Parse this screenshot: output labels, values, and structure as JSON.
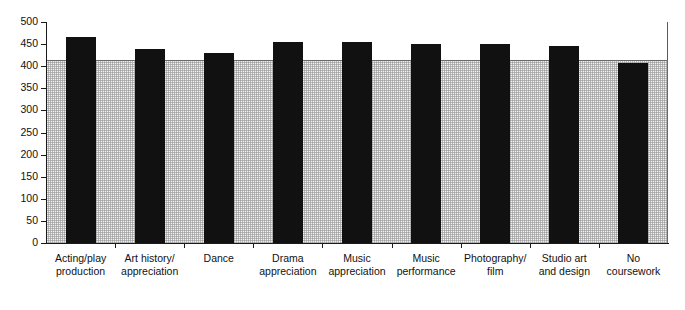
{
  "chart_data": {
    "type": "bar",
    "title": "",
    "xlabel": "",
    "ylabel": "",
    "ylim": [
      0,
      500
    ],
    "ytick_step": 50,
    "yticks": [
      "500",
      "450",
      "400",
      "350",
      "300",
      "250",
      "200",
      "150",
      "100",
      "50",
      "0"
    ],
    "grid": false,
    "legend": null,
    "bar_color": "#111111",
    "plot_background": "#f2f2f2",
    "reference_line": {
      "value": 415,
      "color": "#6a6a6a",
      "label": ""
    },
    "categories": [
      "Acting/play production",
      "Art history/ appreciation",
      "Dance",
      "Drama appreciation",
      "Music appreciation",
      "Music performance",
      "Photography/ film",
      "Studio art and design",
      "No coursework"
    ],
    "category_lines": [
      [
        "Acting/play",
        "production"
      ],
      [
        "Art history/",
        "appreciation"
      ],
      [
        "Dance",
        ""
      ],
      [
        "Drama",
        "appreciation"
      ],
      [
        "Music",
        "appreciation"
      ],
      [
        "Music",
        "performance"
      ],
      [
        "Photography/",
        "film"
      ],
      [
        "Studio art",
        "and design"
      ],
      [
        "No",
        "coursework"
      ]
    ],
    "values": [
      465,
      440,
      431,
      455,
      455,
      450,
      450,
      445,
      408
    ]
  },
  "overflow_text": {
    "top_clipped": "· · · · · · · · · · · · ·"
  }
}
